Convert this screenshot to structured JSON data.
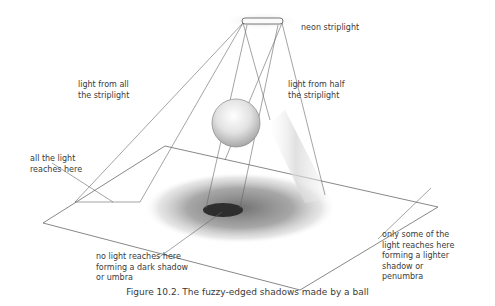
{
  "figure": {
    "caption": "Figure 10.2. The fuzzy-edged shadows made by a ball",
    "labels": {
      "neon_striplight": "neon striplight",
      "light_from_all": "light from all\nthe striplight",
      "light_from_half": "light from half\nthe striplight",
      "all_light_reaches": "all the light\nreaches here",
      "umbra": "no light reaches here\nforming a dark shadow\nor umbra",
      "penumbra": "only some of the\nlight reaches here\nforming a lighter\nshadow or\npenumbra"
    },
    "colors": {
      "line": "#555555",
      "umbra": "#2e2e2e",
      "penumbra": "#8a8a8a",
      "text": "#3a3a3a"
    }
  }
}
